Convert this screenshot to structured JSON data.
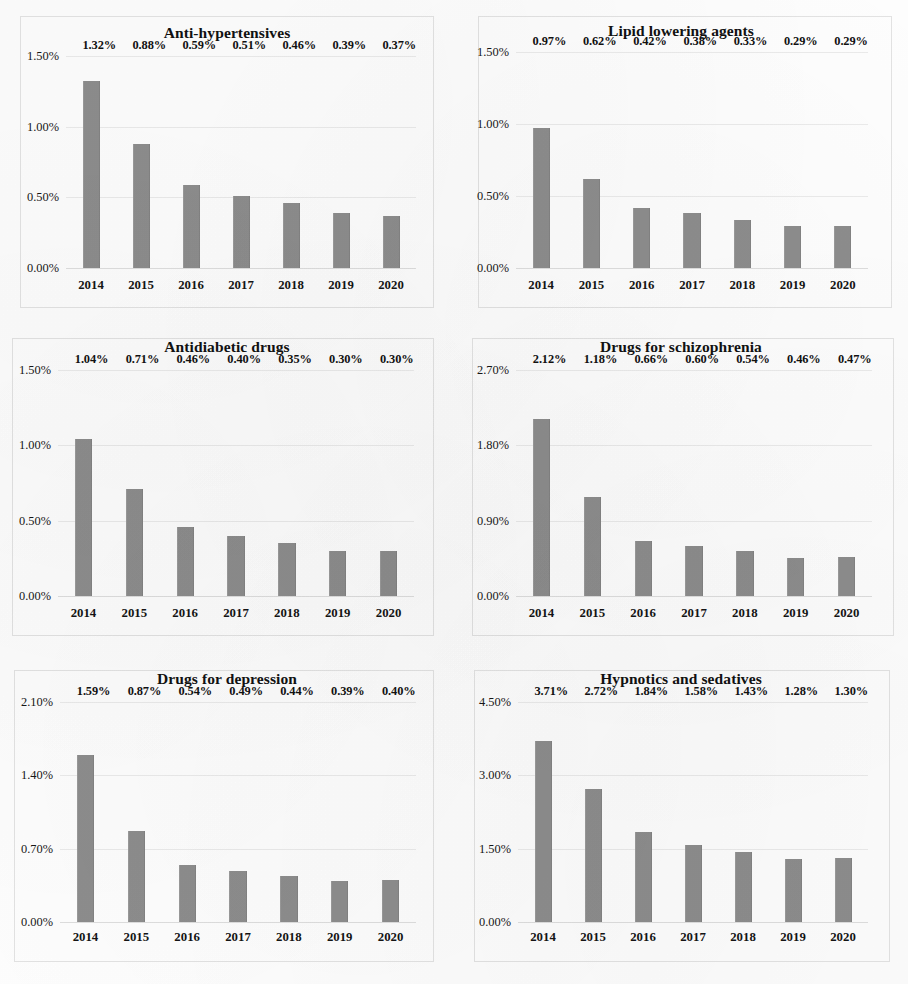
{
  "figure": {
    "bar_color": "#8d8d8d",
    "grid_color": "#ebebeb",
    "panel_border_color": "#e3e3e3",
    "background_color": "#fefefe",
    "layout": "2 columns x 3 rows of small-multiple bar charts"
  },
  "chart_data": [
    {
      "type": "bar",
      "title": "Anti-hypertensives",
      "xlabel": "",
      "ylabel": "",
      "categories": [
        "2014",
        "2015",
        "2016",
        "2017",
        "2018",
        "2019",
        "2020"
      ],
      "values": [
        1.32,
        0.88,
        0.59,
        0.51,
        0.46,
        0.39,
        0.37
      ],
      "data_labels": [
        "1.32%",
        "0.88%",
        "0.59%",
        "0.51%",
        "0.46%",
        "0.39%",
        "0.37%"
      ],
      "ylim": [
        0,
        1.5
      ],
      "yticks": [
        0,
        0.5,
        1.0,
        1.5
      ],
      "ytick_labels": [
        "0.00%",
        "0.50%",
        "1.00%",
        "1.50%"
      ],
      "grid": true,
      "legend": "none"
    },
    {
      "type": "bar",
      "title": "Lipid lowering agents",
      "xlabel": "",
      "ylabel": "",
      "categories": [
        "2014",
        "2015",
        "2016",
        "2017",
        "2018",
        "2019",
        "2020"
      ],
      "values": [
        0.97,
        0.62,
        0.42,
        0.38,
        0.33,
        0.29,
        0.29
      ],
      "data_labels": [
        "0.97%",
        "0.62%",
        "0.42%",
        "0.38%",
        "0.33%",
        "0.29%",
        "0.29%"
      ],
      "ylim": [
        0,
        1.5
      ],
      "yticks": [
        0,
        0.5,
        1.0,
        1.5
      ],
      "ytick_labels": [
        "0.00%",
        "0.50%",
        "1.00%",
        "1.50%"
      ],
      "grid": true,
      "legend": "none"
    },
    {
      "type": "bar",
      "title": "Antidiabetic drugs",
      "xlabel": "",
      "ylabel": "",
      "categories": [
        "2014",
        "2015",
        "2016",
        "2017",
        "2018",
        "2019",
        "2020"
      ],
      "values": [
        1.04,
        0.71,
        0.46,
        0.4,
        0.35,
        0.3,
        0.3
      ],
      "data_labels": [
        "1.04%",
        "0.71%",
        "0.46%",
        "0.40%",
        "0.35%",
        "0.30%",
        "0.30%"
      ],
      "ylim": [
        0,
        1.5
      ],
      "yticks": [
        0,
        0.5,
        1.0,
        1.5
      ],
      "ytick_labels": [
        "0.00%",
        "0.50%",
        "1.00%",
        "1.50%"
      ],
      "grid": true,
      "legend": "none"
    },
    {
      "type": "bar",
      "title": "Drugs for schizophrenia",
      "xlabel": "",
      "ylabel": "",
      "categories": [
        "2014",
        "2015",
        "2016",
        "2017",
        "2018",
        "2019",
        "2020"
      ],
      "values": [
        2.12,
        1.18,
        0.66,
        0.6,
        0.54,
        0.46,
        0.47
      ],
      "data_labels": [
        "2.12%",
        "1.18%",
        "0.66%",
        "0.60%",
        "0.54%",
        "0.46%",
        "0.47%"
      ],
      "ylim": [
        0,
        2.7
      ],
      "yticks": [
        0,
        0.9,
        1.8,
        2.7
      ],
      "ytick_labels": [
        "0.00%",
        "0.90%",
        "1.80%",
        "2.70%"
      ],
      "grid": true,
      "legend": "none"
    },
    {
      "type": "bar",
      "title": "Drugs for depression",
      "xlabel": "",
      "ylabel": "",
      "categories": [
        "2014",
        "2015",
        "2016",
        "2017",
        "2018",
        "2019",
        "2020"
      ],
      "values": [
        1.59,
        0.87,
        0.54,
        0.49,
        0.44,
        0.39,
        0.4
      ],
      "data_labels": [
        "1.59%",
        "0.87%",
        "0.54%",
        "0.49%",
        "0.44%",
        "0.39%",
        "0.40%"
      ],
      "ylim": [
        0,
        2.1
      ],
      "yticks": [
        0,
        0.7,
        1.4,
        2.1
      ],
      "ytick_labels": [
        "0.00%",
        "0.70%",
        "1.40%",
        "2.10%"
      ],
      "grid": true,
      "legend": "none"
    },
    {
      "type": "bar",
      "title": "Hypnotics and sedatives",
      "xlabel": "",
      "ylabel": "",
      "categories": [
        "2014",
        "2015",
        "2016",
        "2017",
        "2018",
        "2019",
        "2020"
      ],
      "values": [
        3.71,
        2.72,
        1.84,
        1.58,
        1.43,
        1.28,
        1.3
      ],
      "data_labels": [
        "3.71%",
        "2.72%",
        "1.84%",
        "1.58%",
        "1.43%",
        "1.28%",
        "1.30%"
      ],
      "ylim": [
        0,
        4.5
      ],
      "yticks": [
        0,
        1.5,
        3.0,
        4.5
      ],
      "ytick_labels": [
        "0.00%",
        "1.50%",
        "3.00%",
        "4.50%"
      ],
      "grid": true,
      "legend": "none"
    }
  ]
}
